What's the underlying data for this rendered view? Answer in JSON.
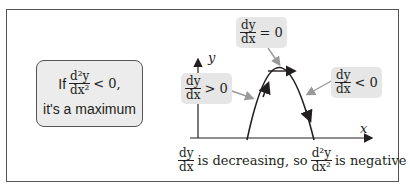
{
  "diagram": {
    "callout": {
      "prefix": "If",
      "frac_num": "d²y",
      "frac_den": "dx²",
      "condition": "< 0,",
      "conclusion": "it's a maximum"
    },
    "axes": {
      "x_label": "x",
      "y_label": "y"
    },
    "labels": {
      "left": {
        "num": "dy",
        "den": "dx",
        "relation": "> 0"
      },
      "top": {
        "num": "dy",
        "den": "dx",
        "relation": "= 0"
      },
      "right": {
        "num": "dy",
        "den": "dx",
        "relation": "< 0"
      }
    },
    "bottom_text": {
      "frac1_num": "dy",
      "frac1_den": "dx",
      "middle": "is decreasing, so",
      "frac2_num": "d²y",
      "frac2_den": "dx²",
      "end": "is negative"
    },
    "colors": {
      "label_bg": "#e6e6e6",
      "callout_bg": "#ececec",
      "arrow": "#9a9a9a",
      "curve": "#231f20"
    }
  }
}
